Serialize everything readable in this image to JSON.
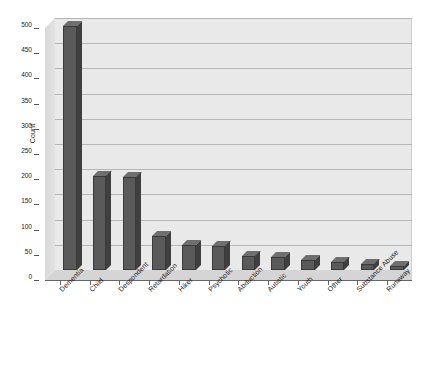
{
  "chart_data": {
    "type": "bar",
    "title": "",
    "xlabel": "",
    "ylabel": "Count",
    "ylim": [
      0,
      500
    ],
    "ytick_step": 50,
    "yticks": [
      0,
      50,
      100,
      150,
      200,
      250,
      300,
      350,
      400,
      450,
      500
    ],
    "grid": true,
    "legend": "none",
    "style": "3d-bar",
    "categories": [
      "Dementia",
      "Child",
      "Despondent",
      "Retardation",
      "Hiker",
      "Psychotic",
      "Abduction",
      "Autistic",
      "Youth",
      "Other",
      "Substance Abuse",
      "Runaway"
    ],
    "values": [
      485,
      186,
      185,
      67,
      49,
      48,
      27,
      26,
      20,
      15,
      12,
      8
    ],
    "colors": {
      "bar_front": "#5a5a5a",
      "bar_side": "#3f3f3f",
      "bar_top": "#6f6f6f",
      "plot_background": "#e9e9e9",
      "gridline": "#b6b6b6",
      "page_background": "#ffffff",
      "axis": "#666666",
      "text": "#1a1a1a"
    }
  },
  "axis": {
    "y_title": "Count"
  }
}
